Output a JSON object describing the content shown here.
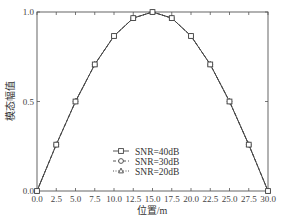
{
  "chart_data": {
    "type": "line",
    "title": "",
    "xlabel": "位置/m",
    "ylabel": "模态幅值",
    "xlim": [
      0,
      30
    ],
    "ylim": [
      0,
      1.0
    ],
    "grid": false,
    "legend_position": "lower center (inside plot)",
    "x": [
      0.0,
      2.5,
      5.0,
      7.5,
      10.0,
      12.5,
      15.0,
      17.5,
      20.0,
      22.5,
      25.0,
      27.5,
      30.0
    ],
    "xticks": [
      "0.0",
      "2.5",
      "5.0",
      "7.5",
      "10.0",
      "12.5",
      "15.0",
      "17.5",
      "20.0",
      "22.5",
      "25.0",
      "27.5",
      "30.0"
    ],
    "yticks": [
      "0.0",
      "0.5",
      "1.0"
    ],
    "series": [
      {
        "name": "SNR=40dB",
        "marker": "square",
        "linestyle": "solid",
        "values": [
          0.0,
          0.259,
          0.5,
          0.707,
          0.866,
          0.966,
          1.0,
          0.966,
          0.866,
          0.707,
          0.5,
          0.259,
          0.0
        ]
      },
      {
        "name": "SNR=30dB",
        "marker": "circle",
        "linestyle": "dashed",
        "values": [
          0.0,
          0.259,
          0.5,
          0.707,
          0.866,
          0.966,
          1.0,
          0.966,
          0.866,
          0.707,
          0.5,
          0.259,
          0.0
        ]
      },
      {
        "name": "SNR=20dB",
        "marker": "triangle",
        "linestyle": "dotted",
        "values": [
          0.0,
          0.259,
          0.5,
          0.707,
          0.866,
          0.966,
          1.0,
          0.966,
          0.866,
          0.707,
          0.5,
          0.259,
          0.0
        ]
      }
    ]
  },
  "colors": {
    "line": "#444444",
    "axis": "#555555",
    "background": "#ffffff"
  }
}
